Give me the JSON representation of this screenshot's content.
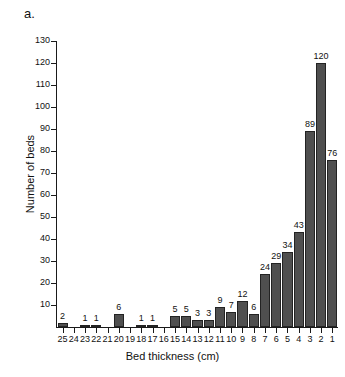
{
  "figure": {
    "panel_label": "a.",
    "background": "#ffffff",
    "bar_color": "#4f4f4f",
    "bar_edge_color": "#232323",
    "axis_color": "#1a1a1a"
  },
  "chart_data": {
    "type": "bar",
    "title": "",
    "xlabel": "Bed thickness (cm)",
    "ylabel": "Number of beds",
    "categories": [
      "25",
      "24",
      "23",
      "22",
      "21",
      "20",
      "19",
      "18",
      "17",
      "16",
      "15",
      "14",
      "13",
      "12",
      "11",
      "10",
      "9",
      "8",
      "7",
      "6",
      "5",
      "4",
      "3",
      "2",
      "1"
    ],
    "values": [
      2,
      0,
      1,
      1,
      0,
      6,
      0,
      1,
      1,
      0,
      5,
      5,
      3,
      3,
      9,
      7,
      12,
      6,
      24,
      29,
      34,
      43,
      89,
      120,
      76
    ],
    "labels": [
      "2",
      "",
      "1",
      "1",
      "",
      "6",
      "",
      "1",
      "1",
      "",
      "5",
      "5",
      "3",
      "3",
      "9",
      "7",
      "12",
      "6",
      "24",
      "29",
      "34",
      "43",
      "89",
      "120",
      "76"
    ],
    "ylim": [
      0,
      130
    ],
    "yticks": [
      0,
      10,
      20,
      30,
      40,
      50,
      60,
      70,
      80,
      90,
      100,
      110,
      120,
      130
    ],
    "ytick_labels": [
      "",
      "10",
      "20",
      "30",
      "40",
      "50",
      "60",
      "70",
      "80",
      "90",
      "100",
      "110",
      "120",
      "130"
    ],
    "grid": false,
    "legend": null
  }
}
